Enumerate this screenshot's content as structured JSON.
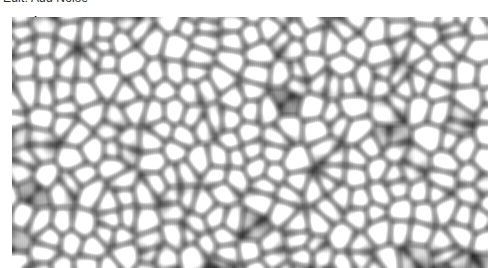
{
  "window": {
    "width": 488,
    "height": 268,
    "background_color": "#ffffff"
  },
  "header": {
    "title": "Edit: Add Noise",
    "title_color": "#2b2b2b",
    "clipped_at_top": true
  },
  "texture": {
    "name": "noise-preview",
    "kind": "cellular-blur-noise",
    "grayscale": true,
    "region": {
      "x": 12,
      "y": 17,
      "width": 476,
      "height": 251
    },
    "cell_size_px": 21,
    "blur_radius_px": 6,
    "color_min": "#151515",
    "color_max": "#ffffff",
    "seed": 20240517
  }
}
